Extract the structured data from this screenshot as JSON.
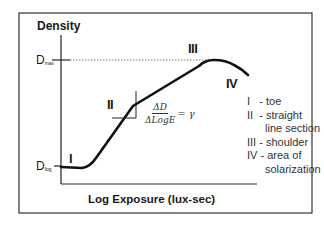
{
  "diagram": {
    "y_axis_label": "Density",
    "x_axis_label": "Log Exposure (lux-sec)",
    "d_max_label": {
      "main": "D",
      "sub": "max"
    },
    "d_fog_label": {
      "main": "D",
      "sub": "fog"
    },
    "region_labels": [
      "I",
      "II",
      "III",
      "IV"
    ],
    "formula": {
      "numerator": "ΔD",
      "denominator": "ΔLogE",
      "result": "= γ"
    },
    "legend": [
      {
        "numeral": "I",
        "text": "- toe"
      },
      {
        "numeral": "II",
        "text": "- straight",
        "continuation": "line section"
      },
      {
        "numeral": "III",
        "text": "- shoulder"
      },
      {
        "numeral": "IV",
        "text": "- area of",
        "continuation": "solarization"
      }
    ],
    "colors": {
      "line": "#111111",
      "frame": "#333333",
      "text": "#1a1a1a"
    }
  }
}
